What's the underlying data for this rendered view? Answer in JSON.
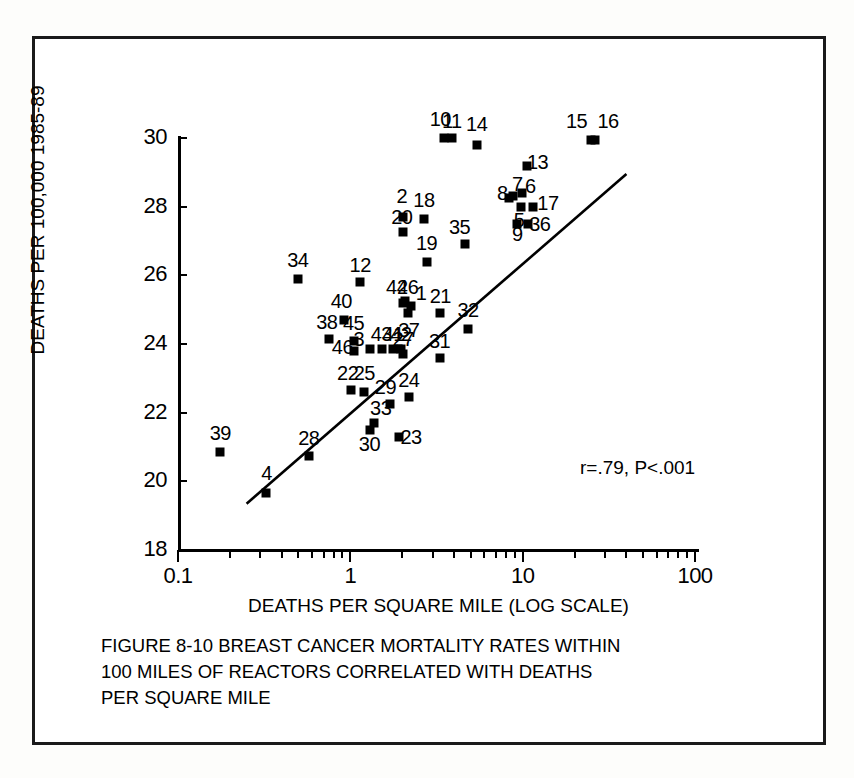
{
  "figure": {
    "caption_lines": [
      "FIGURE 8-10  BREAST CANCER MORTALITY RATES WITHIN",
      "100 MILES OF REACTORS CORRELATED WITH DEATHS",
      " PER SQUARE MILE"
    ]
  },
  "chart_data": {
    "type": "scatter",
    "title": "FIGURE 8-10  BREAST CANCER MORTALITY RATES WITHIN 100 MILES OF REACTORS CORRELATED WITH DEATHS PER SQUARE MILE",
    "xlabel": "DEATHS PER SQUARE MILE (LOG SCALE)",
    "ylabel": "DEATHS PER 100,000 1985-89",
    "xscale": "log",
    "yscale": "linear",
    "xlim": [
      0.1,
      100
    ],
    "ylim": [
      18,
      30
    ],
    "grid": false,
    "legend": false,
    "annotation": "r=.79, P<.001",
    "correlation_r": 0.79,
    "p_value": "<.001",
    "x_tick_labels": [
      "0.1",
      "1",
      "10",
      "100"
    ],
    "x_tick_values": [
      0.1,
      1,
      10,
      100
    ],
    "y_tick_labels": [
      "18",
      "20",
      "22",
      "24",
      "26",
      "28",
      "30"
    ],
    "y_tick_values": [
      18,
      20,
      22,
      24,
      26,
      28,
      30
    ],
    "trendline": {
      "x_start": 0.25,
      "y_start": 19.35,
      "x_end": 40.0,
      "y_end": 28.95
    },
    "point_label_field": "label",
    "points": [
      {
        "label": "1",
        "x": 3.45,
        "y": 24.05,
        "lx": 3.95,
        "ly": 24.45
      },
      {
        "label": "2",
        "x": 3.1,
        "y": 26.65,
        "lx": 3.05,
        "ly": 27.25
      },
      {
        "label": "3",
        "x": 2.0,
        "y": 22.8,
        "lx": 1.72,
        "ly": 23.1
      },
      {
        "label": "4",
        "x": 0.5,
        "y": 18.6,
        "lx": 0.5,
        "ly": 19.2
      },
      {
        "label": "5",
        "x": 15.0,
        "y": 26.95,
        "lx": 14.6,
        "ly": 26.55
      },
      {
        "label": "6",
        "x": 15.3,
        "y": 27.35,
        "lx": 17.0,
        "ly": 27.55
      },
      {
        "label": "7",
        "x": 13.5,
        "y": 27.25,
        "lx": 14.3,
        "ly": 27.6
      },
      {
        "label": "8",
        "x": 12.8,
        "y": 27.2,
        "lx": 11.7,
        "ly": 27.35
      },
      {
        "label": "9",
        "x": 14.3,
        "y": 26.45,
        "lx": 14.3,
        "ly": 26.15
      },
      {
        "label": "10",
        "x": 5.35,
        "y": 28.95,
        "lx": 5.1,
        "ly": 29.5
      },
      {
        "label": "11",
        "x": 5.95,
        "y": 28.95,
        "lx": 5.95,
        "ly": 29.45
      },
      {
        "label": "12",
        "x": 1.75,
        "y": 24.75,
        "lx": 1.75,
        "ly": 25.25
      },
      {
        "label": "13",
        "x": 16.3,
        "y": 28.15,
        "lx": 18.7,
        "ly": 28.25
      },
      {
        "label": "14",
        "x": 8.3,
        "y": 28.75,
        "lx": 8.3,
        "ly": 29.35
      },
      {
        "label": "15",
        "x": 38.0,
        "y": 28.9,
        "lx": 31.5,
        "ly": 29.45
      },
      {
        "label": "16",
        "x": 40.5,
        "y": 28.9,
        "lx": 48.0,
        "ly": 29.45
      },
      {
        "label": "17",
        "x": 17.6,
        "y": 26.95,
        "lx": 21.5,
        "ly": 27.05
      },
      {
        "label": "18",
        "x": 4.1,
        "y": 26.6,
        "lx": 4.1,
        "ly": 27.15
      },
      {
        "label": "19",
        "x": 4.25,
        "y": 25.35,
        "lx": 4.25,
        "ly": 25.9
      },
      {
        "label": "20",
        "x": 3.1,
        "y": 26.2,
        "lx": 3.05,
        "ly": 26.65
      },
      {
        "label": "21",
        "x": 5.1,
        "y": 23.85,
        "lx": 5.1,
        "ly": 24.35
      },
      {
        "label": "22",
        "x": 1.55,
        "y": 21.6,
        "lx": 1.48,
        "ly": 22.1
      },
      {
        "label": "23",
        "x": 2.95,
        "y": 20.25,
        "lx": 3.45,
        "ly": 20.25
      },
      {
        "label": "24",
        "x": 3.35,
        "y": 21.4,
        "lx": 3.35,
        "ly": 21.9
      },
      {
        "label": "25",
        "x": 1.85,
        "y": 21.55,
        "lx": 1.85,
        "ly": 22.1
      },
      {
        "label": "26",
        "x": 3.2,
        "y": 24.2,
        "lx": 3.3,
        "ly": 24.6
      },
      {
        "label": "27",
        "x": 3.1,
        "y": 22.65,
        "lx": 3.1,
        "ly": 23.1
      },
      {
        "label": "28",
        "x": 0.88,
        "y": 19.7,
        "lx": 0.88,
        "ly": 20.2
      },
      {
        "label": "29",
        "x": 2.6,
        "y": 21.2,
        "lx": 2.45,
        "ly": 21.7
      },
      {
        "label": "30",
        "x": 2.0,
        "y": 20.45,
        "lx": 1.98,
        "ly": 20.05
      },
      {
        "label": "31",
        "x": 5.05,
        "y": 22.55,
        "lx": 5.05,
        "ly": 23.05
      },
      {
        "label": "32",
        "x": 7.4,
        "y": 23.4,
        "lx": 7.4,
        "ly": 23.95
      },
      {
        "label": "33",
        "x": 2.1,
        "y": 20.65,
        "lx": 2.3,
        "ly": 21.1
      },
      {
        "label": "34",
        "x": 0.76,
        "y": 24.85,
        "lx": 0.76,
        "ly": 25.4
      },
      {
        "label": "35",
        "x": 7.1,
        "y": 25.85,
        "lx": 6.6,
        "ly": 26.35
      },
      {
        "label": "36",
        "x": 16.4,
        "y": 26.45,
        "lx": 19.3,
        "ly": 26.45
      },
      {
        "label": "37",
        "x": 3.3,
        "y": 23.85,
        "lx": 3.35,
        "ly": 23.35
      },
      {
        "label": "38",
        "x": 1.15,
        "y": 23.1,
        "lx": 1.12,
        "ly": 23.6
      },
      {
        "label": "39",
        "x": 0.27,
        "y": 19.8,
        "lx": 0.27,
        "ly": 20.35
      },
      {
        "label": "40",
        "x": 1.4,
        "y": 23.65,
        "lx": 1.36,
        "ly": 24.2
      },
      {
        "label": "41",
        "x": 2.7,
        "y": 22.8,
        "lx": 2.72,
        "ly": 23.25
      },
      {
        "label": "42",
        "x": 3.0,
        "y": 22.8,
        "lx": 3.02,
        "ly": 23.25
      },
      {
        "label": "43",
        "x": 2.35,
        "y": 22.8,
        "lx": 2.32,
        "ly": 23.25
      },
      {
        "label": "44",
        "x": 3.1,
        "y": 24.15,
        "lx": 2.85,
        "ly": 24.6
      },
      {
        "label": "45",
        "x": 1.62,
        "y": 23.05,
        "lx": 1.6,
        "ly": 23.55
      },
      {
        "label": "46",
        "x": 1.6,
        "y": 22.75,
        "lx": 1.38,
        "ly": 22.85
      }
    ]
  }
}
